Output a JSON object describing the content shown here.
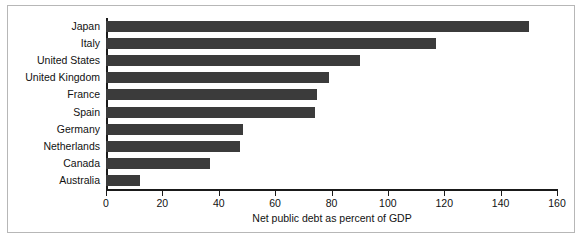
{
  "chart_data": {
    "type": "bar",
    "orientation": "horizontal",
    "title": "",
    "xlabel": "Net public debt as percent of GDP",
    "ylabel": "",
    "categories": [
      "Japan",
      "Italy",
      "United States",
      "United Kingdom",
      "France",
      "Spain",
      "Germany",
      "Netherlands",
      "Canada",
      "Australia"
    ],
    "values": [
      150,
      117,
      90,
      79,
      75,
      74,
      48.5,
      47.5,
      37,
      12
    ],
    "xlim": [
      0,
      160
    ],
    "xticks": [
      0,
      20,
      40,
      60,
      80,
      100,
      120,
      140,
      160
    ],
    "xtick_labels": [
      "0",
      "20",
      "40",
      "60",
      "80",
      "100",
      "120",
      "140",
      "160"
    ],
    "grid": false,
    "legend": false,
    "bar_color": "#3b3b3b",
    "axis_color": "#1a1a1a",
    "frame_color": "#b7b7b7",
    "background": "#ffffff"
  }
}
